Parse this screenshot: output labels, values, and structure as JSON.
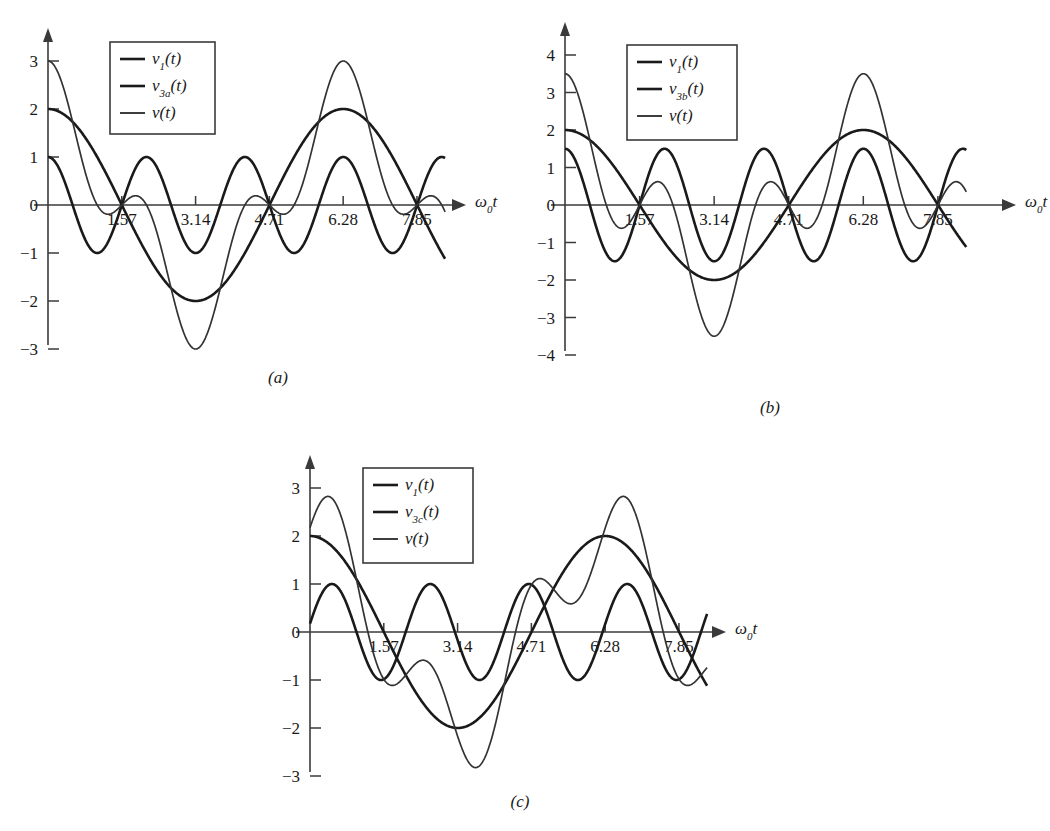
{
  "figure": {
    "type": "multi-panel-line-chart",
    "background": "#ffffff",
    "curve_color": "#1a1a1a",
    "sum_color": "#333333",
    "panel_captions": [
      "(a)",
      "(b)",
      "(c)"
    ]
  },
  "panels": [
    {
      "id": "a",
      "caption": "(a)",
      "xlabel": "ω₀t",
      "xticks": [
        "1.57",
        "3.14",
        "4.71",
        "6.28",
        "7.85"
      ],
      "xtick_values": [
        1.57,
        3.14,
        4.71,
        6.28,
        7.85
      ],
      "yticks": [
        "3",
        "2",
        "1",
        "0",
        "−1",
        "−2",
        "−3"
      ],
      "ytick_values": [
        3,
        2,
        1,
        0,
        -1,
        -2,
        -3
      ],
      "xlim": [
        0,
        8.6
      ],
      "ylim": [
        -3.4,
        3.4
      ],
      "legend": [
        {
          "label_main": "v",
          "label_sub": "1",
          "label_tail": "(t)",
          "series": "fundamental"
        },
        {
          "label_main": "v",
          "label_sub": "3a",
          "label_tail": "(t)",
          "series": "third-harmonic"
        },
        {
          "label_main": "v",
          "label_sub": "",
          "label_tail": "(t)",
          "series": "sum"
        }
      ],
      "series": [
        {
          "name": "v1(t)",
          "amplitude": 2,
          "harmonic": 1,
          "phase_deg": 0,
          "role": "fundamental"
        },
        {
          "name": "v3a(t)",
          "amplitude": 1,
          "harmonic": 3,
          "phase_deg": 0,
          "role": "third-harmonic"
        },
        {
          "name": "v(t)",
          "role": "sum",
          "peak": 3,
          "trough": -3
        }
      ]
    },
    {
      "id": "b",
      "caption": "(b)",
      "xlabel": "ω₀t",
      "xticks": [
        "1.57",
        "3.14",
        "4.71",
        "6.28",
        "7.85"
      ],
      "xtick_values": [
        1.57,
        3.14,
        4.71,
        6.28,
        7.85
      ],
      "yticks": [
        "4",
        "3",
        "2",
        "1",
        "0",
        "−1",
        "−2",
        "−3",
        "−4"
      ],
      "ytick_values": [
        4,
        3,
        2,
        1,
        0,
        -1,
        -2,
        -3,
        -4
      ],
      "xlim": [
        0,
        8.6
      ],
      "ylim": [
        -4.4,
        4.4
      ],
      "legend": [
        {
          "label_main": "v",
          "label_sub": "1",
          "label_tail": "(t)",
          "series": "fundamental"
        },
        {
          "label_main": "v",
          "label_sub": "3b",
          "label_tail": "(t)",
          "series": "third-harmonic"
        },
        {
          "label_main": "v",
          "label_sub": "",
          "label_tail": "(t)",
          "series": "sum"
        }
      ],
      "series": [
        {
          "name": "v1(t)",
          "amplitude": 2,
          "harmonic": 1,
          "phase_deg": 0,
          "role": "fundamental"
        },
        {
          "name": "v3b(t)",
          "amplitude": 1.5,
          "harmonic": 3,
          "phase_deg": 0,
          "role": "third-harmonic"
        },
        {
          "name": "v(t)",
          "role": "sum",
          "peak": 3.5,
          "trough": -3.5
        }
      ]
    },
    {
      "id": "c",
      "caption": "(c)",
      "xlabel": "ω₀t",
      "xticks": [
        "1.57",
        "3.14",
        "4.71",
        "6.28",
        "7.85"
      ],
      "xtick_values": [
        1.57,
        3.14,
        4.71,
        6.28,
        7.85
      ],
      "yticks": [
        "3",
        "2",
        "1",
        "0",
        "−1",
        "−2",
        "−3"
      ],
      "ytick_values": [
        3,
        2,
        1,
        0,
        -1,
        -2,
        -3
      ],
      "xlim": [
        0,
        8.6
      ],
      "ylim": [
        -3.4,
        3.4
      ],
      "legend": [
        {
          "label_main": "v",
          "label_sub": "1",
          "label_tail": "(t)",
          "series": "fundamental"
        },
        {
          "label_main": "v",
          "label_sub": "3c",
          "label_tail": "(t)",
          "series": "third-harmonic"
        },
        {
          "label_main": "v",
          "label_sub": "",
          "label_tail": "(t)",
          "series": "sum"
        }
      ],
      "series": [
        {
          "name": "v1(t)",
          "amplitude": 2,
          "harmonic": 1,
          "phase_deg": 0,
          "role": "fundamental"
        },
        {
          "name": "v3c(t)",
          "amplitude": 1,
          "harmonic": 3,
          "phase_deg": -80,
          "role": "third-harmonic"
        },
        {
          "name": "v(t)",
          "role": "sum",
          "peak": 2.85,
          "trough": -2.75
        }
      ]
    }
  ],
  "chart_data": {
    "type": "line",
    "title": "",
    "xlabel": "ω₀t",
    "ylabel": "",
    "grid": false,
    "legend_position": "upper-left-inside",
    "panels": [
      {
        "panel": "(a)",
        "xlim": [
          0,
          8.6
        ],
        "ylim": [
          -3.4,
          3.4
        ],
        "xticks": [
          1.57,
          3.14,
          4.71,
          6.28,
          7.85
        ],
        "yticks": [
          3,
          2,
          1,
          0,
          -1,
          -2,
          -3
        ],
        "series": [
          {
            "name": "v1(t)",
            "formula": "2*cos(w0*t)",
            "amplitude": 2,
            "harmonic": 1,
            "phase_deg": 0
          },
          {
            "name": "v3a(t)",
            "formula": "1*cos(3*w0*t)",
            "amplitude": 1,
            "harmonic": 3,
            "phase_deg": 0
          },
          {
            "name": "v(t)",
            "formula": "2*cos(w0*t) + 1*cos(3*w0*t)",
            "peak": 3,
            "trough": -3
          }
        ]
      },
      {
        "panel": "(b)",
        "xlim": [
          0,
          8.6
        ],
        "ylim": [
          -4.4,
          4.4
        ],
        "xticks": [
          1.57,
          3.14,
          4.71,
          6.28,
          7.85
        ],
        "yticks": [
          4,
          3,
          2,
          1,
          0,
          -1,
          -2,
          -3,
          -4
        ],
        "series": [
          {
            "name": "v1(t)",
            "formula": "2*cos(w0*t)",
            "amplitude": 2,
            "harmonic": 1,
            "phase_deg": 0
          },
          {
            "name": "v3b(t)",
            "formula": "1.5*cos(3*w0*t)",
            "amplitude": 1.5,
            "harmonic": 3,
            "phase_deg": 0
          },
          {
            "name": "v(t)",
            "formula": "2*cos(w0*t) + 1.5*cos(3*w0*t)",
            "peak": 3.5,
            "trough": -3.5
          }
        ]
      },
      {
        "panel": "(c)",
        "xlim": [
          0,
          8.6
        ],
        "ylim": [
          -3.4,
          3.4
        ],
        "xticks": [
          1.57,
          3.14,
          4.71,
          6.28,
          7.85
        ],
        "yticks": [
          3,
          2,
          1,
          0,
          -1,
          -2,
          -3
        ],
        "series": [
          {
            "name": "v1(t)",
            "formula": "2*cos(w0*t)",
            "amplitude": 2,
            "harmonic": 1,
            "phase_deg": 0
          },
          {
            "name": "v3c(t)",
            "formula": "1*cos(3*w0*t - 80deg)",
            "amplitude": 1,
            "harmonic": 3,
            "phase_deg": -80
          },
          {
            "name": "v(t)",
            "formula": "2*cos(w0*t) + 1*cos(3*w0*t - 80deg)",
            "peak": 2.85,
            "trough": -2.75
          }
        ]
      }
    ]
  }
}
